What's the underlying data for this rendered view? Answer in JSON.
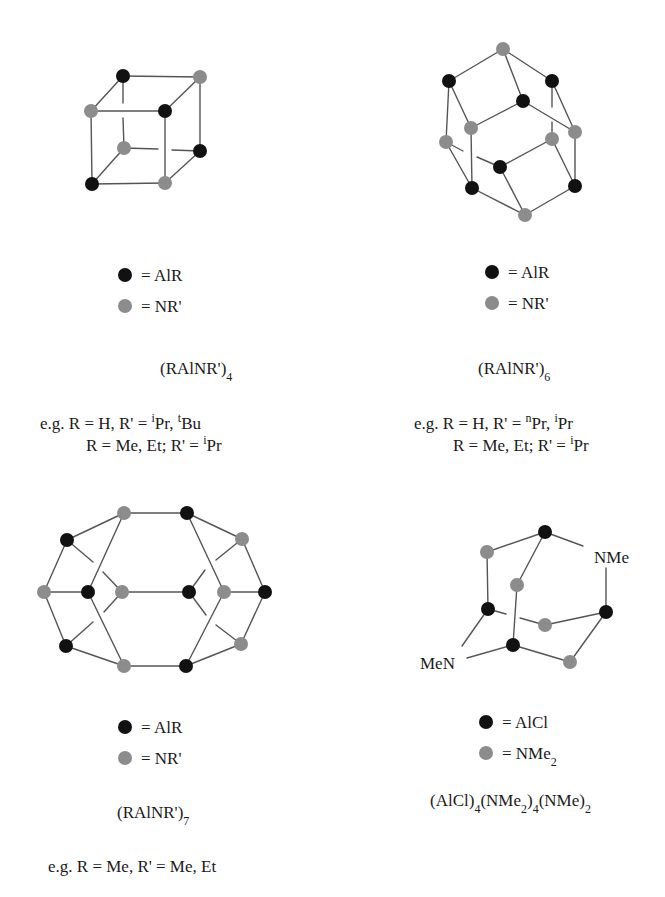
{
  "colors": {
    "background": "#ffffff",
    "al_atom": "#111111",
    "n_atom": "#8c8c8c",
    "bond": "#555555",
    "text": "#1a1a1a"
  },
  "panels": [
    {
      "id": "tetramer",
      "name": "cube-structure",
      "atom_radius": 7,
      "atoms": [
        {
          "x": 123,
          "y": 76,
          "type": "al"
        },
        {
          "x": 200,
          "y": 77,
          "type": "n"
        },
        {
          "x": 91,
          "y": 111,
          "type": "n"
        },
        {
          "x": 165,
          "y": 111,
          "type": "al"
        },
        {
          "x": 124,
          "y": 148,
          "type": "n"
        },
        {
          "x": 200,
          "y": 151,
          "type": "al"
        },
        {
          "x": 92,
          "y": 184,
          "type": "al"
        },
        {
          "x": 165,
          "y": 183,
          "type": "n"
        }
      ],
      "bonds": [
        [
          123,
          76,
          200,
          77
        ],
        [
          91,
          111,
          165,
          111
        ],
        [
          123,
          76,
          91,
          111
        ],
        [
          200,
          77,
          165,
          111
        ],
        [
          91,
          111,
          92,
          184
        ],
        [
          165,
          111,
          165,
          183
        ],
        [
          200,
          77,
          200,
          151
        ],
        [
          92,
          184,
          165,
          183
        ],
        [
          165,
          183,
          200,
          151
        ],
        [
          124,
          148,
          92,
          184
        ],
        [
          123,
          76,
          123,
          103
        ],
        [
          123,
          118,
          124,
          148
        ],
        [
          124,
          148,
          158,
          149
        ],
        [
          172,
          150,
          200,
          151
        ]
      ],
      "labels": [],
      "legend": {
        "x": 125,
        "y1": 275,
        "y2": 306,
        "items": [
          {
            "type": "al",
            "text": "= AlR"
          },
          {
            "type": "n",
            "text": "= NR'"
          }
        ]
      },
      "formula": {
        "x": 160,
        "y": 374,
        "main": "(RAlNR')",
        "sub": "4"
      },
      "examples": {
        "x": 40,
        "y1": 429,
        "y2": 451,
        "line1": [
          {
            "t": "e.g.  R = H, R' = "
          },
          {
            "sup": "i"
          },
          {
            "t": "Pr, "
          },
          {
            "sup": "t"
          },
          {
            "t": "Bu"
          }
        ],
        "line2_x": 86,
        "line2": [
          {
            "t": "R = Me, Et; R' = "
          },
          {
            "sup": "i"
          },
          {
            "t": "Pr"
          }
        ]
      }
    },
    {
      "id": "hexamer",
      "name": "hexagonal-prism-structure",
      "atom_radius": 7,
      "atoms": [
        {
          "x": 503,
          "y": 49,
          "type": "n"
        },
        {
          "x": 449,
          "y": 81,
          "type": "al"
        },
        {
          "x": 552,
          "y": 81,
          "type": "al"
        },
        {
          "x": 523,
          "y": 101,
          "type": "al"
        },
        {
          "x": 471,
          "y": 128,
          "type": "n"
        },
        {
          "x": 575,
          "y": 132,
          "type": "n"
        },
        {
          "x": 446,
          "y": 142,
          "type": "n"
        },
        {
          "x": 552,
          "y": 139,
          "type": "n"
        },
        {
          "x": 500,
          "y": 167,
          "type": "al"
        },
        {
          "x": 472,
          "y": 188,
          "type": "al"
        },
        {
          "x": 575,
          "y": 186,
          "type": "al"
        },
        {
          "x": 525,
          "y": 215,
          "type": "n"
        }
      ],
      "bonds": [
        [
          503,
          49,
          449,
          81
        ],
        [
          503,
          49,
          552,
          81
        ],
        [
          503,
          49,
          523,
          101
        ],
        [
          449,
          81,
          471,
          128
        ],
        [
          449,
          81,
          446,
          142
        ],
        [
          523,
          101,
          471,
          128
        ],
        [
          523,
          101,
          575,
          132
        ],
        [
          552,
          81,
          575,
          132
        ],
        [
          471,
          128,
          472,
          188
        ],
        [
          446,
          142,
          472,
          188
        ],
        [
          575,
          132,
          575,
          186
        ],
        [
          552,
          139,
          575,
          186
        ],
        [
          552,
          139,
          500,
          167
        ],
        [
          500,
          167,
          525,
          215
        ],
        [
          472,
          188,
          525,
          215
        ],
        [
          575,
          186,
          525,
          215
        ],
        [
          446,
          142,
          463,
          151
        ],
        [
          477,
          157,
          500,
          167
        ],
        [
          552,
          81,
          552,
          107
        ],
        [
          552,
          122,
          552,
          139
        ]
      ],
      "labels": [],
      "legend": {
        "x": 492,
        "y1": 272,
        "y2": 303,
        "items": [
          {
            "type": "al",
            "text": "= AlR"
          },
          {
            "type": "n",
            "text": "= NR'"
          }
        ]
      },
      "formula": {
        "x": 478,
        "y": 374,
        "main": "(RAlNR')",
        "sub": "6"
      },
      "examples": {
        "x": 414,
        "y1": 429,
        "y2": 451,
        "line1": [
          {
            "t": "e.g.  R = H, R' = "
          },
          {
            "sup": "n"
          },
          {
            "t": "Pr, "
          },
          {
            "sup": "i"
          },
          {
            "t": "Pr"
          }
        ],
        "line2_x": 453,
        "line2": [
          {
            "t": "R = Me, Et; R' = "
          },
          {
            "sup": "i"
          },
          {
            "t": "Pr"
          }
        ]
      }
    },
    {
      "id": "heptamer",
      "name": "heptamer-cage-structure",
      "atom_radius": 7,
      "atoms": [
        {
          "x": 124,
          "y": 513,
          "type": "n"
        },
        {
          "x": 187,
          "y": 513,
          "type": "al"
        },
        {
          "x": 67,
          "y": 540,
          "type": "al"
        },
        {
          "x": 242,
          "y": 539,
          "type": "n"
        },
        {
          "x": 44,
          "y": 592,
          "type": "n"
        },
        {
          "x": 88,
          "y": 592,
          "type": "al"
        },
        {
          "x": 122,
          "y": 592,
          "type": "n"
        },
        {
          "x": 189,
          "y": 592,
          "type": "al"
        },
        {
          "x": 224,
          "y": 592,
          "type": "n"
        },
        {
          "x": 265,
          "y": 592,
          "type": "al"
        },
        {
          "x": 66,
          "y": 646,
          "type": "al"
        },
        {
          "x": 241,
          "y": 644,
          "type": "n"
        },
        {
          "x": 124,
          "y": 666,
          "type": "n"
        },
        {
          "x": 186,
          "y": 666,
          "type": "al"
        }
      ],
      "bonds": [
        [
          124,
          513,
          187,
          513
        ],
        [
          124,
          513,
          67,
          540
        ],
        [
          187,
          513,
          242,
          539
        ],
        [
          67,
          540,
          44,
          592
        ],
        [
          242,
          539,
          265,
          592
        ],
        [
          44,
          592,
          88,
          592
        ],
        [
          224,
          592,
          265,
          592
        ],
        [
          122,
          592,
          189,
          592
        ],
        [
          44,
          592,
          66,
          646
        ],
        [
          265,
          592,
          241,
          644
        ],
        [
          66,
          646,
          124,
          666
        ],
        [
          241,
          644,
          186,
          666
        ],
        [
          124,
          666,
          186,
          666
        ],
        [
          124,
          513,
          88,
          592
        ],
        [
          88,
          592,
          124,
          666
        ],
        [
          187,
          513,
          224,
          592
        ],
        [
          224,
          592,
          186,
          666
        ],
        [
          67,
          540,
          93,
          562
        ],
        [
          103,
          572,
          122,
          592
        ],
        [
          66,
          646,
          93,
          622
        ],
        [
          104,
          612,
          122,
          592
        ],
        [
          242,
          539,
          216,
          560
        ],
        [
          205,
          570,
          189,
          592
        ],
        [
          241,
          644,
          216,
          625
        ],
        [
          206,
          615,
          189,
          592
        ]
      ],
      "labels": [],
      "legend": {
        "x": 125,
        "y1": 727,
        "y2": 758,
        "items": [
          {
            "type": "al",
            "text": "= AlR"
          },
          {
            "type": "n",
            "text": "= NR'"
          }
        ]
      },
      "formula": {
        "x": 117,
        "y": 818,
        "main": "(RAlNR')",
        "sub": "7"
      },
      "examples": {
        "x": 48,
        "y1": 872,
        "y2": 0,
        "line1": [
          {
            "t": "e.g.  R = Me, R' = Me, Et"
          }
        ],
        "line2_x": 0,
        "line2": []
      }
    },
    {
      "id": "aminoalane",
      "name": "adamantane-like-cage-structure",
      "atom_radius": 7,
      "atoms": [
        {
          "x": 545,
          "y": 532,
          "type": "al"
        },
        {
          "x": 487,
          "y": 552,
          "type": "n"
        },
        {
          "x": 517,
          "y": 585,
          "type": "n"
        },
        {
          "x": 488,
          "y": 609,
          "type": "al"
        },
        {
          "x": 606,
          "y": 612,
          "type": "al"
        },
        {
          "x": 545,
          "y": 625,
          "type": "n"
        },
        {
          "x": 513,
          "y": 645,
          "type": "al"
        },
        {
          "x": 570,
          "y": 662,
          "type": "n"
        }
      ],
      "bonds": [
        [
          545,
          532,
          487,
          552
        ],
        [
          545,
          532,
          517,
          585
        ],
        [
          545,
          532,
          583,
          546
        ],
        [
          606,
          568,
          606,
          612
        ],
        [
          487,
          552,
          488,
          609
        ],
        [
          517,
          585,
          513,
          645
        ],
        [
          488,
          609,
          462,
          646
        ],
        [
          467,
          658,
          513,
          645
        ],
        [
          513,
          645,
          570,
          662
        ],
        [
          570,
          662,
          606,
          612
        ],
        [
          606,
          612,
          545,
          625
        ],
        [
          488,
          609,
          506,
          614
        ],
        [
          520,
          618,
          545,
          625
        ]
      ],
      "labels": [
        {
          "x": 594,
          "y": 563,
          "text": "NMe",
          "name": "nme-bridge-label-top"
        },
        {
          "x": 420,
          "y": 669,
          "text": "MeN",
          "name": "nme-bridge-label-bottom"
        }
      ],
      "legend": {
        "x": 486,
        "y1": 722,
        "y2": 753,
        "items": [
          {
            "type": "al",
            "text": "= AlCl"
          },
          {
            "type": "n",
            "text": "= NMe",
            "sub": "2"
          }
        ]
      },
      "formula_rich": {
        "x": 430,
        "y": 806,
        "parts": [
          {
            "t": "(AlCl)"
          },
          {
            "sub": "4"
          },
          {
            "t": "(NMe"
          },
          {
            "sub": "2"
          },
          {
            "t": ")"
          },
          {
            "sub": "4"
          },
          {
            "t": "(NMe)"
          },
          {
            "sub": "2"
          }
        ]
      }
    }
  ]
}
